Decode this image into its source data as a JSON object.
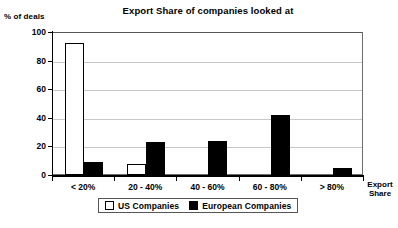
{
  "chart_data": {
    "type": "bar",
    "title": "Export Share of companies looked at",
    "xlabel": "Export Share",
    "ylabel": "% of deals",
    "categories": [
      "< 20%",
      "20 - 40%",
      "40 - 60%",
      "60 - 80%",
      "> 80%"
    ],
    "series": [
      {
        "name": "US Companies",
        "color": "#ffffff",
        "values": [
          92,
          8,
          0,
          0,
          0
        ]
      },
      {
        "name": "European Companies",
        "color": "#000000",
        "values": [
          9,
          23,
          24,
          42,
          5
        ]
      }
    ],
    "ylim": [
      0,
      100
    ],
    "yticks": [
      0,
      20,
      40,
      60,
      80,
      100
    ],
    "ytick_labels": [
      "0",
      "20",
      "40",
      "60",
      "80",
      "100"
    ],
    "grid": true,
    "legend_position": "bottom"
  },
  "axis_title_lines": [
    "Export",
    "Share"
  ]
}
